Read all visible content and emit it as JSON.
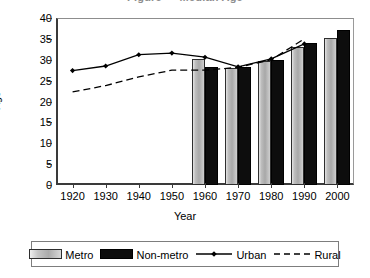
{
  "chart_data": {
    "type": "bar",
    "title": "",
    "xlabel": "Year",
    "ylabel": "Age",
    "categories": [
      "1920",
      "1930",
      "1940",
      "1950",
      "1960",
      "1970",
      "1980",
      "1990",
      "2000"
    ],
    "x": [
      1920,
      1930,
      1940,
      1950,
      1960,
      1970,
      1980,
      1990,
      2000
    ],
    "xlim": [
      1915,
      2005
    ],
    "ylim": [
      0,
      40
    ],
    "ytick_labels": [
      "0",
      "5",
      "10",
      "15",
      "20",
      "25",
      "30",
      "35",
      "40"
    ],
    "yticks": [
      0,
      5,
      10,
      15,
      20,
      25,
      30,
      35,
      40
    ],
    "grid": false,
    "legend_position": "bottom",
    "series": [
      {
        "name": "Metro",
        "kind": "bar",
        "color": "#b0b0b0",
        "x": [
          1960,
          1970,
          1980,
          1990,
          2000
        ],
        "values": [
          30.1,
          28.0,
          29.8,
          33.0,
          35.1
        ]
      },
      {
        "name": "Non-metro",
        "kind": "bar",
        "color": "#0d0d0d",
        "x": [
          1960,
          1970,
          1980,
          1990,
          2000
        ],
        "values": [
          28.3,
          28.3,
          30.0,
          33.9,
          37.1
        ]
      },
      {
        "name": "Urban",
        "kind": "line-solid-marker",
        "color": "#000000",
        "marker": "diamond",
        "x": [
          1920,
          1930,
          1940,
          1950,
          1960,
          1970,
          1980,
          1990
        ],
        "values": [
          27.4,
          28.5,
          31.2,
          31.6,
          30.6,
          28.3,
          30.2,
          33.8
        ]
      },
      {
        "name": "Rural",
        "kind": "line-dashed",
        "color": "#000000",
        "marker": "none",
        "x": [
          1920,
          1930,
          1940,
          1950,
          1960,
          1970,
          1980,
          1990
        ],
        "values": [
          22.3,
          23.8,
          25.9,
          27.5,
          27.5,
          28.2,
          30.0,
          35.0
        ]
      }
    ]
  },
  "axes": {
    "y_title": "Age",
    "x_title": "Year"
  },
  "legend": {
    "items": [
      {
        "label": "Metro",
        "swatch": "metro-bar-swatch"
      },
      {
        "label": "Non-metro",
        "swatch": "nonmetro-bar-swatch"
      },
      {
        "label": "Urban",
        "swatch": "urban-line-swatch"
      },
      {
        "label": "Rural",
        "swatch": "rural-line-swatch"
      }
    ]
  },
  "title_sliver": {
    "text": "Figure — Median Age"
  }
}
